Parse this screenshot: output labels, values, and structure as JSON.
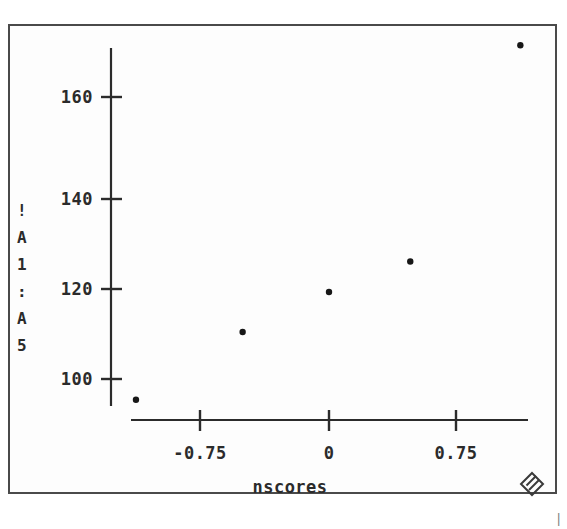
{
  "window": {
    "frame_color": "#4a4a4a",
    "background": "#ffffff"
  },
  "icons": {
    "resize_grip": "resize-grip-diamond"
  },
  "footer": {
    "stray_mark": "|"
  },
  "chart_data": {
    "type": "scatter",
    "title": "",
    "subtitle": "",
    "xlabel": "nscores",
    "ylabel": "!A1:A5",
    "ylabel_chars": [
      "!",
      "A",
      "1",
      ":",
      "A",
      "5"
    ],
    "x": [
      -1.14,
      -0.51,
      0.0,
      0.48,
      1.13
    ],
    "y": [
      95.6,
      110.0,
      118.5,
      125.0,
      171.0
    ],
    "points": [
      {
        "x": -1.14,
        "y": 95.6
      },
      {
        "x": -0.51,
        "y": 110.0
      },
      {
        "x": 0.0,
        "y": 118.5
      },
      {
        "x": 0.48,
        "y": 125.0
      },
      {
        "x": 1.13,
        "y": 171.0
      }
    ],
    "xticks": [
      -0.75,
      0,
      0.75
    ],
    "xtick_labels": [
      "-0.75",
      "0",
      "0.75"
    ],
    "yticks": [
      100,
      120,
      140,
      160
    ],
    "ytick_labels": [
      "100",
      "120",
      "140",
      "160"
    ],
    "xlim": [
      -1.3,
      1.3
    ],
    "ylim": [
      92,
      176
    ],
    "grid": false,
    "legend": null,
    "marker": "dot",
    "marker_color": "#171717",
    "axis_color": "#2b2b2b"
  }
}
